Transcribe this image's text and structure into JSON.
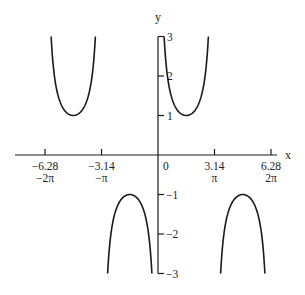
{
  "chart_data": {
    "type": "line",
    "title": "",
    "function": "y = csc(x)",
    "xlabel": "x",
    "ylabel": "y",
    "xlim": [
      -6.9,
      6.55
    ],
    "ylim": [
      -3,
      3
    ],
    "grid": false,
    "legend": null,
    "x_ticks": [
      {
        "value": -6.2832,
        "label": "-6.28",
        "sublabel": "-2π"
      },
      {
        "value": -3.1416,
        "label": "-3.14",
        "sublabel": "-π"
      },
      {
        "value": 3.1416,
        "label": "3.14",
        "sublabel": "π"
      },
      {
        "value": 6.2832,
        "label": "6.28",
        "sublabel": "2π"
      }
    ],
    "origin_label": "0",
    "y_ticks": [
      {
        "value": 3,
        "label": "3"
      },
      {
        "value": 2,
        "label": "2"
      },
      {
        "value": 1,
        "label": "1"
      },
      {
        "value": -1,
        "label": "-1"
      },
      {
        "value": -2,
        "label": "-2"
      },
      {
        "value": -3,
        "label": "-3"
      }
    ],
    "series": [
      {
        "name": "csc(x) branch (-2π, -π)",
        "x_range": [
          -5.944,
          -3.481
        ],
        "extremum": {
          "x": -4.712,
          "y": 1
        }
      },
      {
        "name": "csc(x) branch (-π, 0)",
        "x_range": [
          -2.802,
          -0.3398
        ],
        "extremum": {
          "x": -1.571,
          "y": -1
        }
      },
      {
        "name": "csc(x) branch (0, π)",
        "x_range": [
          0.3398,
          2.802
        ],
        "extremum": {
          "x": 1.571,
          "y": 1
        }
      },
      {
        "name": "csc(x) branch (π, 2π)",
        "x_range": [
          3.481,
          5.944
        ],
        "extremum": {
          "x": 4.712,
          "y": -1
        }
      }
    ],
    "clip_abs_y": 3,
    "line_color": "#1a1a1a",
    "axis_color": "#1a1a1a"
  }
}
